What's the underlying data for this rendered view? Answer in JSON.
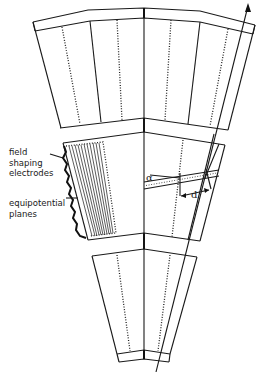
{
  "figure": {
    "type": "detector-sector-schematic",
    "labels": {
      "field_shaping": [
        "field",
        "shaping",
        "electrodes"
      ],
      "equipotential": [
        "equipotential",
        "planes"
      ],
      "alpha": "α",
      "d": "d"
    },
    "colors": {
      "line": "#1a1a1a",
      "background": "#ffffff"
    }
  }
}
